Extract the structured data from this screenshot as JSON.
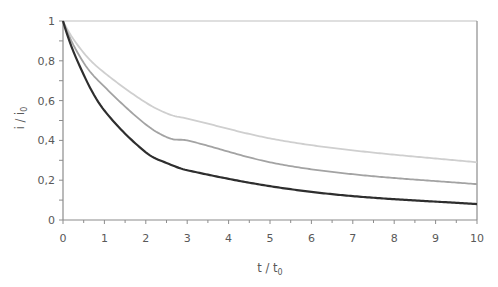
{
  "chart_data": {
    "type": "line",
    "title": "",
    "xlabel": "t / t₀",
    "ylabel": "i / i₀",
    "xlim": [
      0,
      10
    ],
    "ylim": [
      0,
      1
    ],
    "x_ticks": [
      "0",
      "1",
      "2",
      "3",
      "4",
      "5",
      "6",
      "7",
      "8",
      "9",
      "10"
    ],
    "y_ticks": [
      "0",
      "0,2",
      "0,4",
      "0,6",
      "0,8",
      "1"
    ],
    "x_minor_step": 0.5,
    "y_minor_step": 0.1,
    "grid": false,
    "legend": null,
    "x": [
      0,
      0.5,
      1,
      2,
      2.58,
      3,
      5,
      7,
      10
    ],
    "series": [
      {
        "name": "light-gray curve",
        "color": "#cfcfcf",
        "values": [
          1.0,
          0.84,
          0.74,
          0.59,
          0.53,
          0.51,
          0.41,
          0.35,
          0.29
        ]
      },
      {
        "name": "mid-gray curve",
        "color": "#a3a3a3",
        "values": [
          1.0,
          0.79,
          0.67,
          0.48,
          0.41,
          0.4,
          0.29,
          0.23,
          0.18
        ]
      },
      {
        "name": "dark curve",
        "color": "#2e2e2e",
        "values": [
          1.0,
          0.73,
          0.55,
          0.34,
          0.28,
          0.25,
          0.17,
          0.12,
          0.08
        ]
      }
    ]
  },
  "colors": {
    "axis": "#8c8c8c",
    "tick_text": "#595959"
  }
}
